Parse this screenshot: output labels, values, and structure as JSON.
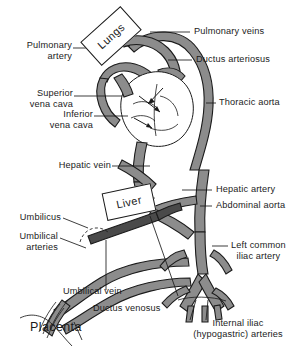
{
  "figure": {
    "type": "anatomical-diagram",
    "background_color": "#ffffff",
    "ink_color": "#1b1b1b",
    "vessel_fill_color": "#8c8c8c",
    "vessel_fill_dark": "#4a4a4a",
    "organ_box_fill": "#ffffff"
  },
  "organ_boxes": [
    {
      "id": "lungs",
      "label": "Lungs",
      "rotation_deg": -42
    },
    {
      "id": "liver",
      "label": "Liver",
      "rotation_deg": -12
    }
  ],
  "labels": {
    "pulmonary_artery": "Pulmonary\nartery",
    "pulmonary_artery_l1": "Pulmonary",
    "pulmonary_artery_l2": "artery",
    "superior_vena_cava_l1": "Superior",
    "superior_vena_cava_l2": "vena cava",
    "inferior_vena_cava_l1": "Inferior",
    "inferior_vena_cava_l2": "vena cava",
    "hepatic_vein": "Hepatic vein",
    "umbilicus": "Umbilicus",
    "umbilical_arteries_l1": "Umbilical",
    "umbilical_arteries_l2": "arteries",
    "umbilical_vein": "Umbilical  vein",
    "ductus_venosus": "Ductus venosus",
    "placenta": "Placenta",
    "pulmonary_veins": "Pulmonary  veins",
    "ductus_arteriosus": "Ductus arteriosus",
    "thoracic_aorta": "Thoracic  aorta",
    "hepatic_artery": "Hepatic  artery",
    "abdominal_aorta": "Abdominal  aorta",
    "left_common_iliac_artery_l1": "Left  common",
    "left_common_iliac_artery_l2": "iliac artery",
    "internal_iliac_arteries_l1": "Internal iliac",
    "internal_iliac_arteries_l2": "(hypogastric) arteries"
  }
}
